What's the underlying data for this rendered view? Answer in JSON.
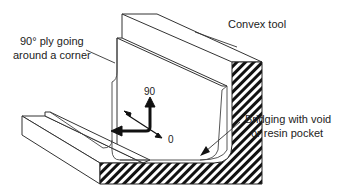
{
  "diagram": {
    "labels": {
      "ply_line1": "90° ply going",
      "ply_line2": "around a corner",
      "tool": "Convex tool",
      "bridging_line1": "Bridging with void",
      "bridging_line2": "or resin pocket"
    },
    "axes": {
      "vertical": "90",
      "diagonal": "0"
    },
    "colors": {
      "line": "#222222",
      "background": "#ffffff",
      "hatch": "#111111"
    }
  }
}
